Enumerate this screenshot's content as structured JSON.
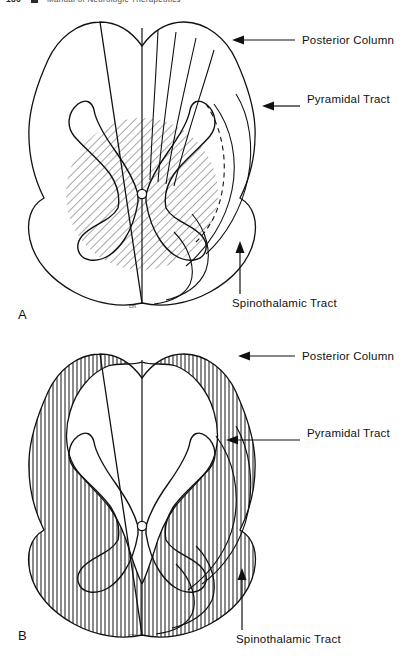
{
  "header": {
    "page_number": "186",
    "marker": "square-bullet",
    "title": "Manual of Neurologic Therapeutics"
  },
  "figure": {
    "scale_mark": "cm",
    "panels": [
      {
        "id": "A",
        "letter": "A",
        "hatch_style": "diagonal",
        "hatch_region": "central-circle",
        "scale_mark": "cm",
        "labels": [
          {
            "name": "posterior-column",
            "text": "Posterior Column",
            "lines": [
              "Posterior Column"
            ],
            "pointer": "arrow-left"
          },
          {
            "name": "pyramidal-tract",
            "text": "Pyramidal Tract",
            "lines": [
              "Pyramidal",
              "Tract"
            ],
            "pointer": "arrow-left"
          },
          {
            "name": "spinothalamic-tract",
            "text": "Spinothalamic Tract",
            "lines": [
              "Spinothalamic Tract"
            ],
            "pointer": "arrow-up"
          }
        ]
      },
      {
        "id": "B",
        "letter": "B",
        "hatch_style": "vertical",
        "hatch_region": "white-matter-periphery",
        "scale_mark": "cm",
        "labels": [
          {
            "name": "posterior-column",
            "text": "Posterior Column",
            "lines": [
              "Posterior Column"
            ],
            "pointer": "arrow-left"
          },
          {
            "name": "pyramidal-tract",
            "text": "Pyramidal Tract",
            "lines": [
              "Pyramidal",
              "Tract"
            ],
            "pointer": "arrow-left"
          },
          {
            "name": "spinothalamic-tract",
            "text": "Spinothalamic Tract",
            "lines": [
              "Spinothalamic Tract"
            ],
            "pointer": "arrow-up"
          }
        ]
      }
    ]
  },
  "colors": {
    "ink": "#111111",
    "background": "#ffffff",
    "hatch": "#555555"
  }
}
